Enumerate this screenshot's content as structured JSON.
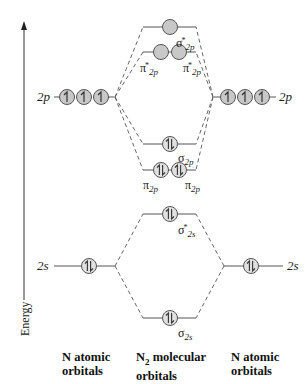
{
  "axis": {
    "label": "Energy",
    "direction": "up"
  },
  "left_atom": {
    "levels": [
      {
        "label": "2p",
        "orbitals": 3,
        "electrons": [
          "up",
          "up",
          "up"
        ]
      },
      {
        "label": "2s",
        "orbitals": 1,
        "electrons": [
          "pair"
        ]
      }
    ],
    "footer_line1": "N atomic",
    "footer_line2": "orbitals"
  },
  "right_atom": {
    "levels": [
      {
        "label": "2p",
        "orbitals": 3,
        "electrons": [
          "up",
          "up",
          "up"
        ]
      },
      {
        "label": "2s",
        "orbitals": 1,
        "electrons": [
          "pair"
        ]
      }
    ],
    "footer_line1": "N atomic",
    "footer_line2": "orbitals"
  },
  "molecule": {
    "footer_prefix": "N",
    "footer_subscript": "2",
    "footer_line1_rest": " molecular",
    "footer_line2": "orbitals",
    "levels": [
      {
        "id": "sigma_star_2p",
        "symbol": "σ",
        "sub": "2p",
        "sup": "*",
        "orbitals": 1,
        "electrons": [
          "empty"
        ]
      },
      {
        "id": "pi_star_2p",
        "symbol": "π",
        "sub": "2p",
        "sup": "*",
        "orbitals": 2,
        "electrons": [
          "empty",
          "empty"
        ]
      },
      {
        "id": "sigma_2p",
        "symbol": "σ",
        "sub": "2p",
        "sup": "",
        "orbitals": 1,
        "electrons": [
          "pair"
        ]
      },
      {
        "id": "pi_2p",
        "symbol": "π",
        "sub": "2p",
        "sup": "",
        "orbitals": 2,
        "electrons": [
          "pair",
          "pair"
        ]
      },
      {
        "id": "sigma_star_2s",
        "symbol": "σ",
        "sub": "2s",
        "sup": "*",
        "orbitals": 1,
        "electrons": [
          "pair"
        ]
      },
      {
        "id": "sigma_2s",
        "symbol": "σ",
        "sub": "2s",
        "sup": "",
        "orbitals": 1,
        "electrons": [
          "pair"
        ]
      }
    ]
  },
  "colors": {
    "orbital_fill": "#c8c8c8",
    "line": "#555555",
    "text": "#222222"
  }
}
